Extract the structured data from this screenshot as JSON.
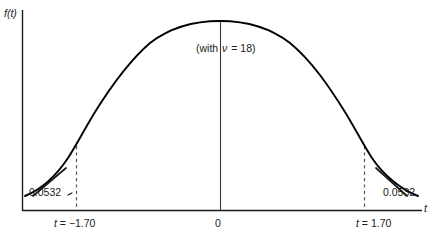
{
  "figure": {
    "axis_y_label": "f(t)",
    "axis_x_label": "t",
    "annotation": {
      "prefix": "(with",
      "symbol": "ν",
      "equals_value": "= 18)"
    }
  },
  "labels": {
    "area_left": "0.0532",
    "area_right": "0.0532",
    "tick_left": "t = −1.70",
    "tick_center": "0",
    "tick_right": "t = 1.70"
  },
  "colors": {
    "curve": "#000000",
    "axis": "#1a1a1a",
    "dashed": "#555555",
    "background": "#ffffff",
    "text": "#1a1a1a"
  },
  "chart_data": {
    "type": "line",
    "title": "",
    "subtitle": "",
    "xlabel": "t",
    "ylabel": "f(t)",
    "distribution": "Student t density",
    "degrees_of_freedom": 18,
    "xlim": [
      -3.2,
      3.2
    ],
    "ylim": [
      0,
      0.42
    ],
    "grid": false,
    "legend": null,
    "tick_labels_x": [
      "t = −1.70",
      "0",
      "t = 1.70"
    ],
    "tick_values_x": [
      -1.7,
      0,
      1.7
    ],
    "annotations": [
      {
        "text": "(with ν = 18)",
        "x": 0.0,
        "y": 0.33
      },
      {
        "text": "0.0532",
        "x": -1.7,
        "y": 0.02,
        "meaning": "left tail area"
      },
      {
        "text": "0.0532",
        "x": 1.7,
        "y": 0.02,
        "meaning": "right tail area"
      }
    ],
    "markers": [
      {
        "type": "vertical-solid",
        "x": 0.0
      },
      {
        "type": "vertical-dashed",
        "x": -1.7
      },
      {
        "type": "vertical-dashed",
        "x": 1.7
      }
    ],
    "x": [
      -3.2,
      -3.0,
      -2.8,
      -2.6,
      -2.4,
      -2.2,
      -2.0,
      -1.8,
      -1.7,
      -1.6,
      -1.4,
      -1.2,
      -1.0,
      -0.8,
      -0.6,
      -0.4,
      -0.2,
      0.0,
      0.2,
      0.4,
      0.6,
      0.8,
      1.0,
      1.2,
      1.4,
      1.6,
      1.7,
      1.8,
      2.0,
      2.2,
      2.4,
      2.6,
      2.8,
      3.0,
      3.2
    ],
    "y": [
      0.0059,
      0.0087,
      0.0127,
      0.0183,
      0.0258,
      0.0358,
      0.0487,
      0.0648,
      0.0742,
      0.0842,
      0.1066,
      0.1318,
      0.1589,
      0.1866,
      0.2134,
      0.2377,
      0.2581,
      0.2734,
      0.2581,
      0.2377,
      0.2134,
      0.1866,
      0.1589,
      0.1318,
      0.1066,
      0.0842,
      0.0742,
      0.0648,
      0.0487,
      0.0358,
      0.0258,
      0.0183,
      0.0127,
      0.0087,
      0.0059
    ]
  }
}
